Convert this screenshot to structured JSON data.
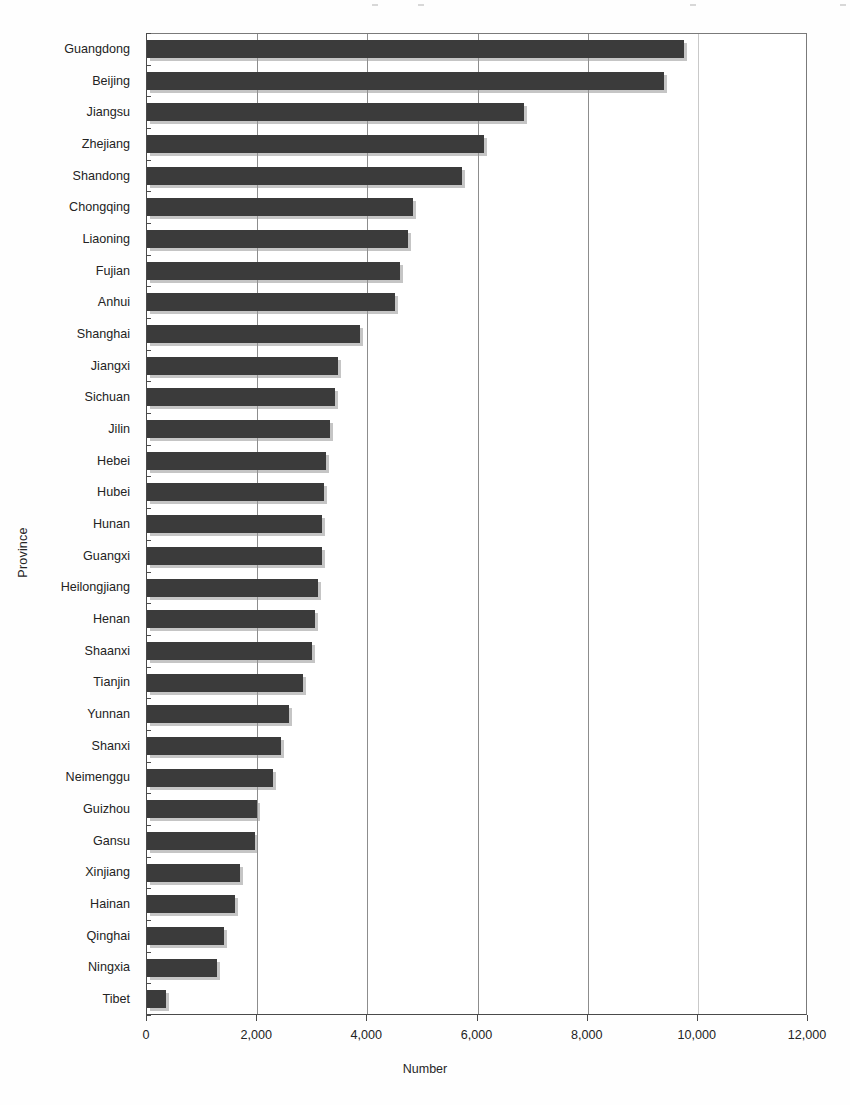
{
  "chart_data": {
    "type": "bar",
    "orientation": "horizontal",
    "title": "",
    "xlabel": "Number",
    "ylabel": "Province",
    "xlim": [
      0,
      12000
    ],
    "ylim": null,
    "grid": true,
    "legend": null,
    "xticks": [
      "0",
      "2,000",
      "4,000",
      "6,000",
      "8,000",
      "10,000",
      "12,000"
    ],
    "xtick_values": [
      0,
      2000,
      4000,
      6000,
      8000,
      10000,
      12000
    ],
    "categories": [
      "Guangdong",
      "Beijing",
      "Jiangsu",
      "Zhejiang",
      "Shandong",
      "Chongqing",
      "Liaoning",
      "Fujian",
      "Anhui",
      "Shanghai",
      "Jiangxi",
      "Sichuan",
      "Jilin",
      "Hebei",
      "Hubei",
      "Hunan",
      "Guangxi",
      "Heilongjiang",
      "Henan",
      "Shaanxi",
      "Tianjin",
      "Yunnan",
      "Shanxi",
      "Neimenggu",
      "Guizhou",
      "Gansu",
      "Xinjiang",
      "Hainan",
      "Qinghai",
      "Ningxia",
      "Tibet"
    ],
    "values": [
      9750,
      9380,
      6850,
      6120,
      5720,
      4830,
      4740,
      4600,
      4500,
      3870,
      3460,
      3420,
      3320,
      3250,
      3210,
      3180,
      3170,
      3100,
      3050,
      3000,
      2840,
      2570,
      2430,
      2280,
      1990,
      1960,
      1690,
      1600,
      1390,
      1270,
      340
    ],
    "bar_color": "#3b3b3b"
  }
}
